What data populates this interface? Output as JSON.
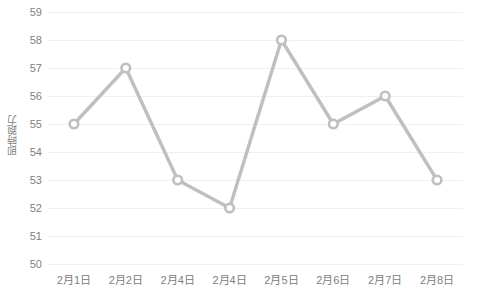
{
  "chart_data": {
    "type": "line",
    "title": "",
    "subtitle": "",
    "xlabel": "",
    "ylabel": "即時跑力",
    "categories": [
      "2月1日",
      "2月2日",
      "2月4日",
      "2月4日",
      "2月5日",
      "2月6日",
      "2月7日",
      "2月8日"
    ],
    "values": [
      55,
      57,
      53,
      52,
      58,
      55,
      56,
      53
    ],
    "series": [
      {
        "name": "即時跑力",
        "values": [
          55,
          57,
          53,
          52,
          58,
          55,
          56,
          53
        ]
      }
    ],
    "ylim": [
      50,
      59
    ],
    "ytick_step": 1,
    "yticks": [
      59,
      58,
      57,
      56,
      55,
      54,
      53,
      52,
      51,
      50
    ],
    "grid": "horizontal",
    "legend": "none",
    "marker": "open-circle",
    "colors": {
      "line": "#bfbfbf",
      "marker_stroke": "#bfbfbf",
      "marker_fill": "#ffffff",
      "gridline": "#f0f0f0",
      "tick_text": "#808080",
      "axis_title": "#7f7f7f",
      "background": "#ffffff"
    }
  },
  "axis": {
    "y_title": "即時跑力"
  }
}
